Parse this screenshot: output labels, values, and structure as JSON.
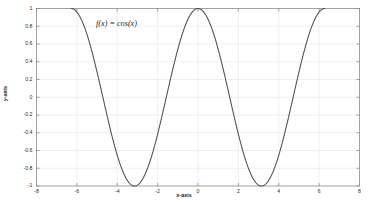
{
  "chart_data": {
    "type": "line",
    "title": "",
    "annotation": "f(x) = cos(x)",
    "xlabel": "x-axis",
    "ylabel": "y-axis",
    "xlim": [
      -8,
      8
    ],
    "ylim": [
      -1,
      1
    ],
    "grid": true,
    "legend": "none",
    "line_color": "#555555",
    "background_color": "#ffffff",
    "grid_color": "#e8e8ee",
    "axis_color": "#8a8a8a",
    "xticks": [
      -8,
      -6,
      -4,
      -2,
      0,
      2,
      4,
      6,
      8
    ],
    "xtick_labels": [
      "-8",
      "-6",
      "-4",
      "-2",
      "0",
      "2",
      "4",
      "6",
      "8"
    ],
    "yticks": [
      1,
      0.8,
      0.6,
      0.4,
      0.2,
      0,
      -0.2,
      -0.4,
      -0.6,
      -0.8,
      -1
    ],
    "ytick_labels": [
      "1",
      "0.8",
      "0.6",
      "0.4",
      "0.2",
      "0",
      "-0.2",
      "-0.4",
      "-0.6",
      "-0.8",
      "-1"
    ],
    "series": [
      {
        "name": "cos(x)",
        "expression": "cos(x)",
        "x_start": -6.2832,
        "x_end": 6.2832,
        "x": [
          -6.2832,
          -6.1104,
          -5.9376,
          -5.7648,
          -5.592,
          -5.4192,
          -5.2464,
          -5.0736,
          -4.9008,
          -4.728,
          -4.5552,
          -4.3824,
          -4.2096,
          -4.0368,
          -3.864,
          -3.6912,
          -3.5184,
          -3.3456,
          -3.1728,
          -3.0,
          -2.8272,
          -2.6544,
          -2.4816,
          -2.3088,
          -2.136,
          -1.9632,
          -1.7904,
          -1.6176,
          -1.4448,
          -1.272,
          -1.0992,
          -0.9264,
          -0.7536,
          -0.5808,
          -0.408,
          -0.2352,
          -0.0624,
          0.1104,
          0.2832,
          0.456,
          0.6288,
          0.8016,
          0.9744,
          1.1472,
          1.32,
          1.4928,
          1.6656,
          1.8384,
          2.0112,
          2.184,
          2.3568,
          2.5296,
          2.7024,
          2.8752,
          3.048,
          3.2208,
          3.3936,
          3.5664,
          3.7392,
          3.912,
          4.0848,
          4.2576,
          4.4304,
          4.6032,
          4.776,
          4.9488,
          5.1216,
          5.2944,
          5.4672,
          5.64,
          5.8128,
          5.9856,
          6.1584,
          6.2832
        ],
        "y": [
          1.0,
          0.985,
          0.941,
          0.87,
          0.774,
          0.655,
          0.518,
          0.367,
          0.207,
          0.042,
          -0.124,
          -0.287,
          -0.441,
          -0.584,
          -0.711,
          -0.818,
          -0.903,
          -0.964,
          -0.998,
          -0.99,
          -0.951,
          -0.883,
          -0.789,
          -0.673,
          -0.539,
          -0.39,
          -0.232,
          -0.068,
          0.098,
          0.262,
          0.453,
          0.601,
          0.729,
          0.836,
          0.918,
          0.972,
          0.998,
          0.994,
          0.96,
          0.898,
          0.809,
          0.695,
          0.562,
          0.415,
          0.249,
          0.078,
          -0.095,
          -0.263,
          -0.425,
          -0.572,
          -0.704,
          -0.813,
          -0.9,
          -0.962,
          -0.995,
          -0.994,
          -0.972,
          -0.918,
          -0.836,
          -0.729,
          -0.601,
          -0.453,
          -0.29,
          -0.118,
          0.064,
          0.237,
          0.401,
          0.549,
          0.683,
          0.796,
          0.885,
          0.95,
          0.988,
          1.0
        ]
      }
    ]
  },
  "axes": {
    "xlabel": "x-axis",
    "ylabel": "y-axis"
  },
  "annotation": {
    "text": "f(x) = cos(x)"
  },
  "xticks": [
    {
      "label": "-8"
    },
    {
      "label": "-6"
    },
    {
      "label": "-4"
    },
    {
      "label": "-2"
    },
    {
      "label": "0"
    },
    {
      "label": "2"
    },
    {
      "label": "4"
    },
    {
      "label": "6"
    },
    {
      "label": "8"
    }
  ],
  "yticks": [
    {
      "label": "1"
    },
    {
      "label": "0.8"
    },
    {
      "label": "0.6"
    },
    {
      "label": "0.4"
    },
    {
      "label": "0.2"
    },
    {
      "label": "0"
    },
    {
      "label": "-0.2"
    },
    {
      "label": "-0.4"
    },
    {
      "label": "-0.6"
    },
    {
      "label": "-0.8"
    },
    {
      "label": "-1"
    }
  ]
}
